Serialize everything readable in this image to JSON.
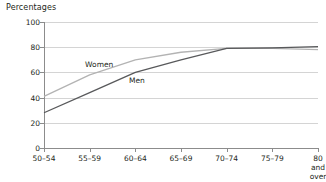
{
  "chart_data": {
    "type": "line",
    "title": "Percentages",
    "xlabel": "",
    "ylabel": "Percentages",
    "ylim": [
      0,
      100
    ],
    "ytick_values": [
      0,
      20,
      40,
      60,
      80,
      100
    ],
    "ytick_labels": [
      "0",
      "20",
      "40",
      "60",
      "80",
      "100"
    ],
    "grid": true,
    "legend": "inline-labels",
    "categories": [
      "50–54",
      "55–59",
      "60–64",
      "65–69",
      "70–74",
      "75–79",
      "80 and\nover"
    ],
    "series": [
      {
        "name": "Women",
        "color": "#b3b3b3",
        "values": [
          41,
          58,
          70,
          76,
          79,
          79,
          78
        ],
        "label_x_pct": 15,
        "label_y_value": 66
      },
      {
        "name": "Men",
        "color": "#58595b",
        "values": [
          28,
          44,
          60,
          70,
          79,
          79.5,
          80.5
        ],
        "label_x_pct": 31,
        "label_y_value": 53
      }
    ]
  }
}
